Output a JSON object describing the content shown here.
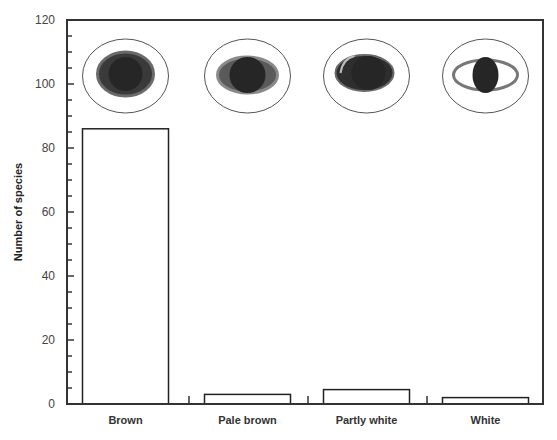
{
  "chart_data": {
    "type": "bar",
    "title": "",
    "xlabel": "",
    "ylabel": "Number of species",
    "categories": [
      "Brown",
      "Pale brown",
      "Partly white",
      "White"
    ],
    "values": [
      86,
      3,
      4.5,
      2
    ],
    "ylim": [
      0,
      120
    ],
    "yticks": [
      0,
      20,
      40,
      60,
      80,
      100,
      120
    ],
    "minor_tick_step": 5,
    "grid": false,
    "legend": "none",
    "annotations": [
      {
        "category": "Brown",
        "icon": "eye-brown-iris-icon",
        "description": "eye with dark brown iris filling almost entire eye"
      },
      {
        "category": "Pale brown",
        "icon": "eye-pale-brown-iris-icon",
        "description": "eye with dark pupil and pale brown iris ring"
      },
      {
        "category": "Partly white",
        "icon": "eye-partly-white-iris-icon",
        "description": "eye with partially white sclera visible on one side"
      },
      {
        "category": "White",
        "icon": "eye-white-sclera-icon",
        "description": "eye with dark pupil and clearly visible white sclera"
      }
    ],
    "colors": {
      "bar_fill": "#ffffff",
      "bar_stroke": "#222222",
      "axis": "#333333",
      "iris_dark": "#2b2b2b",
      "iris_rim": "#555555"
    }
  }
}
